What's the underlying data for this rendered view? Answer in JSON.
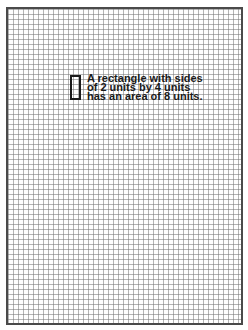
{
  "diagram": {
    "type": "graph-paper-area-illustration",
    "grid": {
      "cell_size_px": 5,
      "line_color": "#787878",
      "border_color": "#4a4a4a"
    },
    "rectangle": {
      "width_units": 2,
      "height_units": 4,
      "area_units": 8,
      "stroke_color": "#1a1a1a"
    },
    "caption": {
      "lines": [
        "A rectangle with sides",
        "of 2 units by 4 units",
        "has an area of 8 units."
      ]
    }
  }
}
